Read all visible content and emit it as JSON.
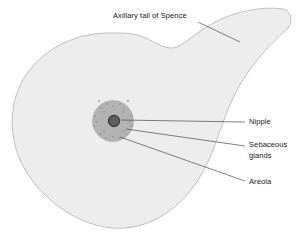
{
  "figure": {
    "background_color": "#ffffff"
  },
  "colors": {
    "breast_fill": "#ededed",
    "breast_outline": "#b9b9b9",
    "areola_fill": "#b3b3b3",
    "areola_outline": "#a6a6a6",
    "nipple_fill": "#5e5e5e",
    "nipple_outline": "#343434",
    "gland_dot": "#9a9a9a",
    "leader_line": "#4a4a4a",
    "label_text": "#1a1a1a"
  },
  "labels": {
    "axillary_tail": "Axillary tail of Spence",
    "nipple": "Nipple",
    "sebaceous_glands_line1": "Sebaceous",
    "sebaceous_glands_line2": "glands",
    "areola": "Areola"
  },
  "label_positions": {
    "axillary_tail": {
      "x": 113,
      "y": 18
    },
    "nipple": {
      "x": 249,
      "y": 124
    },
    "sebaceous_line1": {
      "x": 249,
      "y": 147
    },
    "sebaceous_line2": {
      "x": 249,
      "y": 158
    },
    "areola": {
      "x": 249,
      "y": 184
    }
  },
  "shapes": {
    "breast_outline_path": "M 113 33 C 78 32 45 47 26 75 C 9 100 8 134 21 162 C 36 194 72 224 112 228 C 151 231 183 207 203 172 C 216 148 222 120 234 96 C 247 69 268 46 286 30 C 294 23 292 11 283 9 C 263 6 236 11 215 22 C 196 32 182 47 173 48 C 163 49 152 40 141 36 C 132 33 122 33 113 33 Z",
    "areola": {
      "cx": 113,
      "cy": 121,
      "r": 20.5
    },
    "nipple": {
      "cx": 114,
      "cy": 121,
      "r": 5.6
    },
    "gland_dots_r": 1.0,
    "gland_dots": [
      {
        "x": 113,
        "y": 106
      },
      {
        "x": 124,
        "y": 108
      },
      {
        "x": 101,
        "y": 108
      },
      {
        "x": 131,
        "y": 116
      },
      {
        "x": 95,
        "y": 116
      },
      {
        "x": 99,
        "y": 101
      },
      {
        "x": 128,
        "y": 101
      },
      {
        "x": 132,
        "y": 126
      },
      {
        "x": 94,
        "y": 126
      },
      {
        "x": 126,
        "y": 134
      },
      {
        "x": 101,
        "y": 134
      },
      {
        "x": 113,
        "y": 137
      },
      {
        "x": 107,
        "y": 104
      },
      {
        "x": 120,
        "y": 104
      },
      {
        "x": 119,
        "y": 138
      },
      {
        "x": 106,
        "y": 138
      },
      {
        "x": 97,
        "y": 122
      },
      {
        "x": 130,
        "y": 122
      },
      {
        "x": 104,
        "y": 112
      },
      {
        "x": 123,
        "y": 131
      },
      {
        "x": 104,
        "y": 131
      },
      {
        "x": 123,
        "y": 112
      }
    ]
  },
  "leader_lines": {
    "axillary_tail": "M 198 22 L 240 42",
    "nipple": "M 121 120 L 245 122",
    "sebaceous_glands": "M 126 129 L 245 146",
    "areola": "M 120 137 L 245 181"
  }
}
